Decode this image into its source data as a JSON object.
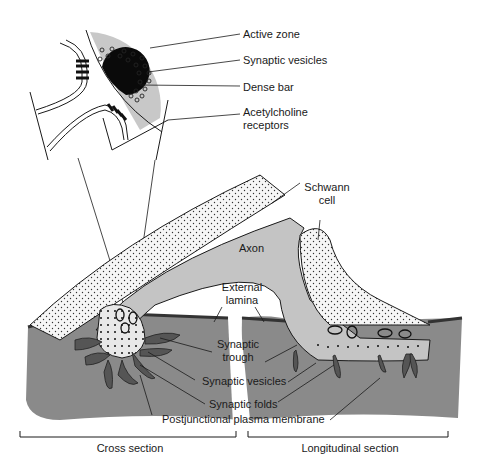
{
  "colors": {
    "muscle": "#8a8a8a",
    "fold": "#555555",
    "axon": "#c4c4c4",
    "active_zone": "#c8c8c8",
    "dense_bar": "#0a0a0a",
    "line": "#1a1a1a",
    "schwann": "#f4f4f4"
  },
  "inset_labels": {
    "active_zone": "Active zone",
    "synaptic_vesicles": "Synaptic vesicles",
    "dense_bar": "Dense bar",
    "ach_receptors_1": "Acetylcholine",
    "ach_receptors_2": "receptors"
  },
  "main_labels": {
    "schwann_1": "Schwann",
    "schwann_2": "cell",
    "axon": "Axon",
    "external_lamina_1": "External",
    "external_lamina_2": "lamina",
    "synaptic_trough_1": "Synaptic",
    "synaptic_trough_2": "trough",
    "synaptic_vesicles": "Synaptic vesicles",
    "synaptic_folds": "Synaptic folds",
    "postjunctional_membrane": "Postjunctional plasma membrane"
  },
  "section_labels": {
    "cross": "Cross section",
    "longitudinal": "Longitudinal section"
  }
}
